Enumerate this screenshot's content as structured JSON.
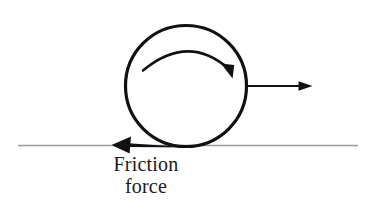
{
  "figure": {
    "kind": "physics-free-body-diagram",
    "background_color": "#ffffff",
    "ink_color": "#111111",
    "ground_color": "#9a9a9a",
    "labels": {
      "friction_line1": "Friction",
      "friction_line2": "force"
    },
    "elements": {
      "wheel": {
        "name": "wheel-circle",
        "center_x": 186,
        "center_y": 86,
        "radius": 61,
        "stroke_width": 3.2,
        "color": "#111111"
      },
      "rotation_arrow": {
        "name": "clockwise-rotation-arrow",
        "start_x": 143,
        "start_y": 70,
        "end_x": 231,
        "end_y": 72,
        "direction": "clockwise",
        "stroke_width": 2.4,
        "color": "#111111"
      },
      "velocity_arrow": {
        "name": "velocity-arrow",
        "start_x": 248,
        "start_y": 86,
        "end_x": 312,
        "end_y": 86,
        "direction": "right",
        "stroke_width": 2.0,
        "color": "#111111"
      },
      "friction_arrow": {
        "name": "friction-force-arrow",
        "start_x": 192,
        "start_y": 145,
        "end_x": 112,
        "end_y": 145,
        "direction": "left",
        "stroke_width": 5.0,
        "color": "#111111"
      },
      "ground_line": {
        "name": "ground-line",
        "start_x": 18,
        "end_x": 358,
        "y": 145,
        "stroke_width": 1.6,
        "color": "#9a9a9a"
      }
    }
  }
}
